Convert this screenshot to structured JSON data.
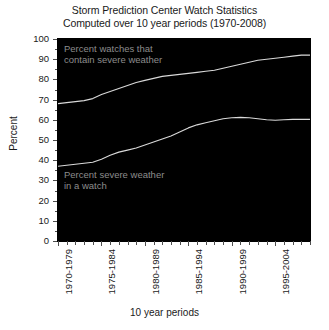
{
  "title": {
    "line1": "Storm Prediction Center Watch Statistics",
    "line2": "Computed over 10 year periods (1970-2008)"
  },
  "annotations": {
    "upper": "Percent watches that\ncontain severe weather",
    "lower": "Percent severe weather\nin a watch"
  },
  "axis": {
    "ylabel": "Percent",
    "xlabel": "10 year periods"
  },
  "colors": {
    "plot_background": "#000000",
    "line": "#d9d9d9",
    "annotation_text": "#8c8c8c",
    "axis_text": "#1a1a1a",
    "figure_background": "#ffffff"
  },
  "chart_data": {
    "type": "line",
    "title": "Storm Prediction Center Watch Statistics\nComputed over 10 year periods (1970-2008)",
    "xlabel": "10 year periods",
    "ylabel": "Percent",
    "ylim": [
      0,
      100
    ],
    "yticks": [
      0,
      10,
      20,
      30,
      40,
      50,
      60,
      70,
      80,
      90,
      100
    ],
    "grid": false,
    "legend": "annotations-in-plot",
    "x_tick_count": 30,
    "x_labeled_ticks": [
      {
        "index": 0,
        "label": "1970-1979"
      },
      {
        "index": 5,
        "label": "1975-1984"
      },
      {
        "index": 10,
        "label": "1980-1989"
      },
      {
        "index": 15,
        "label": "1985-1994"
      },
      {
        "index": 20,
        "label": "1990-1999"
      },
      {
        "index": 25,
        "label": "1995-2004"
      }
    ],
    "categories": [
      "1970-1979",
      "1971-1980",
      "1972-1981",
      "1973-1982",
      "1974-1983",
      "1975-1984",
      "1976-1985",
      "1977-1986",
      "1978-1987",
      "1979-1988",
      "1980-1989",
      "1981-1990",
      "1982-1991",
      "1983-1992",
      "1984-1993",
      "1985-1994",
      "1986-1995",
      "1987-1996",
      "1988-1997",
      "1989-1998",
      "1990-1999",
      "1991-2000",
      "1992-2001",
      "1993-2002",
      "1994-2003",
      "1995-2004",
      "1996-2005",
      "1997-2006",
      "1998-2007",
      "1999-2008"
    ],
    "series": [
      {
        "name": "Percent watches that contain severe weather",
        "values": [
          68.0,
          68.5,
          69.0,
          69.5,
          70.5,
          72.5,
          74.0,
          75.5,
          77.0,
          78.5,
          79.5,
          80.5,
          81.5,
          82.0,
          82.5,
          83.0,
          83.5,
          84.0,
          84.5,
          85.5,
          86.5,
          87.5,
          88.5,
          89.5,
          90.0,
          90.5,
          91.0,
          91.5,
          92.0,
          92.0
        ]
      },
      {
        "name": "Percent severe weather in a watch",
        "values": [
          37.0,
          37.5,
          38.0,
          38.5,
          39.0,
          40.5,
          42.5,
          44.0,
          45.0,
          46.0,
          47.5,
          49.0,
          50.5,
          52.0,
          54.0,
          56.0,
          57.5,
          58.5,
          59.5,
          60.5,
          61.0,
          61.2,
          61.0,
          60.5,
          60.0,
          59.8,
          60.0,
          60.2,
          60.2,
          60.2
        ]
      }
    ]
  }
}
